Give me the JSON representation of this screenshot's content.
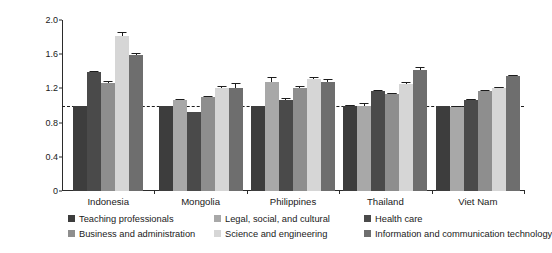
{
  "chart_data": {
    "type": "bar",
    "title": "",
    "subtitle": "",
    "xlabel": "",
    "ylabel": "Wage premia index (teaching = 1)",
    "ylim": [
      0,
      2.0
    ],
    "yticks": [
      0,
      0.4,
      0.8,
      1.2,
      1.6,
      2.0
    ],
    "ytick_labels": [
      "0",
      "0.4",
      "0.8",
      "1.2",
      "1.6",
      "2.0"
    ],
    "grid": false,
    "legend_position": "bottom",
    "reference_line": {
      "value": 1.0,
      "style": "dashed"
    },
    "categories": [
      "Indonesia",
      "Mongolia",
      "Philippines",
      "Thailand",
      "Viet Nam"
    ],
    "series": [
      {
        "name": "Teaching professionals",
        "color": "#3d3d3d",
        "values": [
          1.0,
          1.0,
          0.99,
          1.0,
          0.99
        ],
        "errors": [
          0.0,
          0.0,
          0.0,
          0.01,
          0.0
        ]
      },
      {
        "name": "Legal, social, and cultural",
        "color": "#a8a8a8",
        "values": [
          null,
          1.06,
          1.28,
          1.0,
          0.98
        ],
        "errors": [
          null,
          0.02,
          0.05,
          0.03,
          0.01
        ]
      },
      {
        "name": "Health care",
        "color": "#4a4a4a",
        "values": [
          1.39,
          0.92,
          1.07,
          1.17,
          1.07
        ],
        "errors": [
          0.01,
          0.01,
          0.02,
          0.01,
          0.01
        ]
      },
      {
        "name": "Business and administration",
        "color": "#8e8e8e",
        "values": [
          1.26,
          1.1,
          1.21,
          1.14,
          1.17
        ],
        "errors": [
          0.03,
          0.01,
          0.02,
          0.01,
          0.01
        ]
      },
      {
        "name": "Science and engineering",
        "color": "#d6d6d6",
        "values": [
          1.81,
          1.2,
          1.31,
          1.25,
          1.21
        ],
        "errors": [
          0.05,
          0.03,
          0.02,
          0.02,
          0.01
        ]
      },
      {
        "name": "Information and communication technology",
        "color": "#6e6e6e",
        "values": [
          1.59,
          1.21,
          1.28,
          1.41,
          1.35
        ],
        "errors": [
          0.03,
          0.05,
          0.03,
          0.04,
          0.01
        ]
      }
    ]
  },
  "legend": {
    "items": [
      {
        "label": "Teaching professionals",
        "color": "#3d3d3d"
      },
      {
        "label": "Legal, social, and cultural",
        "color": "#a8a8a8"
      },
      {
        "label": "Health care",
        "color": "#4a4a4a"
      },
      {
        "label": "Business and administration",
        "color": "#8e8e8e"
      },
      {
        "label": "Science and engineering",
        "color": "#d6d6d6"
      },
      {
        "label": "Information and communication technology",
        "color": "#6e6e6e"
      }
    ]
  }
}
